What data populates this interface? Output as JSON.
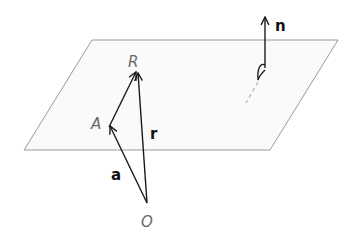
{
  "diagram": {
    "colors": {
      "plane_fill": "#fafafa",
      "plane_edge": "#9a9a9a",
      "vector": "#1a1a1a",
      "point_label": "#6a6a6a",
      "vector_label": "#111111"
    },
    "plane": {
      "corners": [
        [
          92,
          40
        ],
        [
          338,
          40
        ],
        [
          270,
          150
        ],
        [
          24,
          150
        ]
      ]
    },
    "points": {
      "R": {
        "label": "R",
        "x": 137,
        "y": 72
      },
      "A": {
        "label": "A",
        "x": 109,
        "y": 127
      },
      "O": {
        "label": "O",
        "x": 147,
        "y": 203
      }
    },
    "vectors": {
      "a": {
        "label": "a",
        "from": "O",
        "to": "A"
      },
      "r": {
        "label": "r",
        "from": "O",
        "to": "R"
      },
      "AR": {
        "label": "",
        "from": "A",
        "to": "R"
      },
      "n": {
        "label": "n",
        "from": [
          265,
          75
        ],
        "to": [
          265,
          17
        ]
      }
    }
  }
}
